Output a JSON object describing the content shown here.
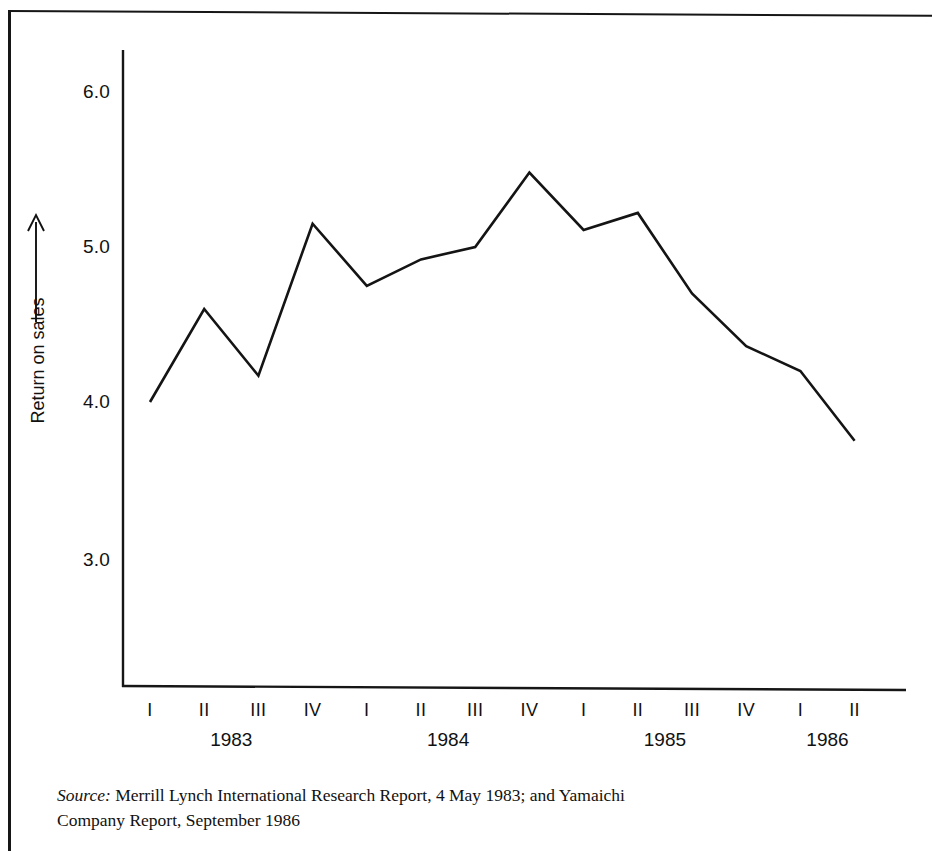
{
  "figure": {
    "y_axis_title": "Return on sales",
    "y_ticks": [
      "6.0",
      "5.0",
      "4.0",
      "3.0"
    ],
    "source_label": "Source:",
    "source_text": "Merrill Lynch International Research Report, 4 May 1983; and Yamaichi",
    "source_text_line2": "Company Report, September 1986",
    "line_color": "#141414",
    "axis_color": "#161616",
    "background": "#ffffff"
  },
  "chart_data": {
    "type": "line",
    "title": "",
    "xlabel": "",
    "ylabel": "Return on sales",
    "ylim": [
      2.5,
      6.35
    ],
    "grid": false,
    "legend": false,
    "quarter_labels": [
      "I",
      "II",
      "III",
      "IV",
      "I",
      "II",
      "III",
      "IV",
      "I",
      "II",
      "III",
      "IV",
      "I",
      "II"
    ],
    "year_groups": [
      {
        "year": "1983",
        "quarters": [
          "I",
          "II",
          "III",
          "IV"
        ]
      },
      {
        "year": "1984",
        "quarters": [
          "I",
          "II",
          "III",
          "IV"
        ]
      },
      {
        "year": "1985",
        "quarters": [
          "I",
          "II",
          "III",
          "IV"
        ]
      },
      {
        "year": "1986",
        "quarters": [
          "I",
          "II"
        ]
      }
    ],
    "categories": [
      "1983 I",
      "1983 II",
      "1983 III",
      "1983 IV",
      "1984 I",
      "1984 II",
      "1984 III",
      "1984 IV",
      "1985 I",
      "1985 II",
      "1985 III",
      "1985 IV",
      "1986 I",
      "1986 II"
    ],
    "values": [
      4.0,
      4.6,
      4.17,
      5.15,
      4.75,
      4.92,
      5.0,
      5.48,
      5.11,
      5.22,
      4.7,
      4.36,
      4.2,
      3.75
    ]
  }
}
